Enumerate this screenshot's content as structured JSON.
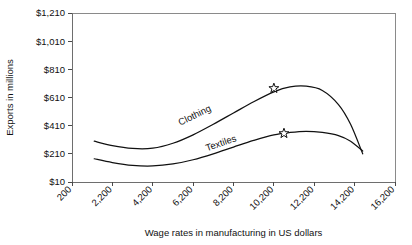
{
  "chart_data": {
    "type": "line",
    "title": "",
    "xlabel": "Wage rates in manufacturing in US dollars",
    "ylabel": "Exports in millions",
    "grid": false,
    "legend_position": "inline-curve-labels",
    "xtick_labels": [
      "200",
      "2,200",
      "4,200",
      "6,200",
      "8,200",
      "10,200",
      "12,200",
      "14,200",
      "16,200"
    ],
    "xtick_values": [
      200,
      2200,
      4200,
      6200,
      8200,
      10200,
      12200,
      14200,
      16200
    ],
    "ytick_labels": [
      "$10",
      "$210",
      "$410",
      "$610",
      "$810",
      "$1,010",
      "$1,210"
    ],
    "ytick_values": [
      10,
      210,
      410,
      610,
      810,
      1010,
      1210
    ],
    "xlim": [
      200,
      16200
    ],
    "ylim": [
      10,
      1210
    ],
    "series": [
      {
        "name": "Clothing",
        "label": "Clothing",
        "color": "#111111",
        "x": [
          1300,
          2200,
          3200,
          4200,
          5200,
          6200,
          7200,
          8200,
          9200,
          10200,
          11000,
          11800,
          12600,
          13400,
          14000,
          14600
        ],
        "values": [
          300,
          268,
          248,
          250,
          285,
          345,
          420,
          500,
          580,
          650,
          685,
          690,
          660,
          560,
          420,
          210
        ],
        "marker": {
          "type": "star",
          "x": 10200,
          "value": 675,
          "name": "clothing-peak-star"
        }
      },
      {
        "name": "Textiles",
        "label": "Textiles",
        "color": "#111111",
        "x": [
          1300,
          2200,
          3200,
          4200,
          5200,
          6200,
          7200,
          8200,
          9200,
          10200,
          11000,
          11800,
          12600,
          13400,
          14000,
          14600
        ],
        "values": [
          175,
          148,
          128,
          124,
          138,
          168,
          210,
          258,
          305,
          345,
          362,
          370,
          362,
          340,
          300,
          230
        ],
        "marker": {
          "type": "star",
          "x": 10700,
          "value": 355,
          "name": "textiles-peak-star"
        }
      }
    ]
  }
}
